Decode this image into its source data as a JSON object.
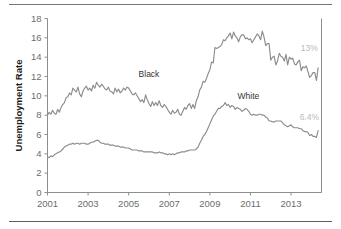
{
  "figure": {
    "background_color": "#ffffff",
    "rule_color": "#6e6e6e",
    "has_top_rule": true,
    "has_bottom_rule": true
  },
  "chart_data": {
    "type": "line",
    "title": "",
    "xlabel": "",
    "ylabel": "Unemployment Rate",
    "xlim": [
      2001.0,
      2014.5
    ],
    "ylim": [
      0,
      18
    ],
    "yticks": [
      0,
      2,
      4,
      6,
      8,
      10,
      12,
      14,
      16,
      18
    ],
    "ytick_labels": [
      "0",
      "2",
      "4",
      "6",
      "8",
      "10",
      "12",
      "14",
      "16",
      "18"
    ],
    "xticks": [
      2001,
      2003,
      2005,
      2007,
      2009,
      2011,
      2013
    ],
    "xtick_labels": [
      "2001",
      "2003",
      "2005",
      "2007",
      "2009",
      "2011",
      "2013"
    ],
    "grid": false,
    "legend_position": "inline-annotation",
    "line_color": "#8c8c8c",
    "annotations": [
      {
        "name": "black-end-value",
        "text": "13%",
        "color": "#b9b9b9",
        "x": 2013.9,
        "y": 14.6
      },
      {
        "name": "white-end-value",
        "text": "6.4%",
        "color": "#b9b9b9",
        "x": 2013.9,
        "y": 7.5
      }
    ],
    "series": [
      {
        "name": "Black",
        "label": "Black",
        "label_x": 2006.0,
        "label_y": 11.9,
        "color": "#8c8c8c",
        "x": [
          2001.0,
          2001.083,
          2001.167,
          2001.25,
          2001.333,
          2001.417,
          2001.5,
          2001.583,
          2001.667,
          2001.75,
          2001.833,
          2001.917,
          2002.0,
          2002.083,
          2002.167,
          2002.25,
          2002.333,
          2002.417,
          2002.5,
          2002.583,
          2002.667,
          2002.75,
          2002.833,
          2002.917,
          2003.0,
          2003.083,
          2003.167,
          2003.25,
          2003.333,
          2003.417,
          2003.5,
          2003.583,
          2003.667,
          2003.75,
          2003.833,
          2003.917,
          2004.0,
          2004.083,
          2004.167,
          2004.25,
          2004.333,
          2004.417,
          2004.5,
          2004.583,
          2004.667,
          2004.75,
          2004.833,
          2004.917,
          2005.0,
          2005.083,
          2005.167,
          2005.25,
          2005.333,
          2005.417,
          2005.5,
          2005.583,
          2005.667,
          2005.75,
          2005.833,
          2005.917,
          2006.0,
          2006.083,
          2006.167,
          2006.25,
          2006.333,
          2006.417,
          2006.5,
          2006.583,
          2006.667,
          2006.75,
          2006.833,
          2006.917,
          2007.0,
          2007.083,
          2007.167,
          2007.25,
          2007.333,
          2007.417,
          2007.5,
          2007.583,
          2007.667,
          2007.75,
          2007.833,
          2007.917,
          2008.0,
          2008.083,
          2008.167,
          2008.25,
          2008.333,
          2008.417,
          2008.5,
          2008.583,
          2008.667,
          2008.75,
          2008.833,
          2008.917,
          2009.0,
          2009.083,
          2009.167,
          2009.25,
          2009.333,
          2009.417,
          2009.5,
          2009.583,
          2009.667,
          2009.75,
          2009.833,
          2009.917,
          2010.0,
          2010.083,
          2010.167,
          2010.25,
          2010.333,
          2010.417,
          2010.5,
          2010.583,
          2010.667,
          2010.75,
          2010.833,
          2010.917,
          2011.0,
          2011.083,
          2011.167,
          2011.25,
          2011.333,
          2011.417,
          2011.5,
          2011.583,
          2011.667,
          2011.75,
          2011.833,
          2011.917,
          2012.0,
          2012.083,
          2012.167,
          2012.25,
          2012.333,
          2012.417,
          2012.5,
          2012.583,
          2012.667,
          2012.75,
          2012.833,
          2012.917,
          2013.0,
          2013.083,
          2013.167,
          2013.25,
          2013.333,
          2013.417,
          2013.5,
          2013.583,
          2013.667,
          2013.75,
          2013.833,
          2013.917,
          2014.0,
          2014.083,
          2014.167,
          2014.25,
          2014.333
        ],
        "y": [
          8.0,
          8.3,
          8.1,
          8.5,
          8.2,
          8.1,
          8.6,
          8.3,
          8.8,
          9.1,
          9.3,
          9.8,
          9.9,
          10.3,
          10.1,
          10.8,
          10.6,
          10.4,
          10.9,
          10.2,
          9.9,
          10.5,
          10.8,
          11.0,
          10.6,
          10.8,
          10.5,
          11.1,
          10.8,
          11.4,
          11.1,
          10.9,
          11.2,
          11.0,
          10.7,
          10.6,
          10.9,
          10.5,
          10.4,
          10.2,
          10.8,
          10.4,
          10.7,
          10.3,
          10.5,
          10.8,
          10.6,
          10.9,
          10.8,
          10.5,
          10.2,
          10.1,
          10.3,
          10.0,
          9.7,
          9.4,
          9.6,
          9.3,
          10.1,
          9.6,
          9.2,
          8.9,
          9.4,
          9.0,
          9.3,
          9.0,
          9.5,
          9.0,
          8.8,
          9.1,
          8.9,
          8.6,
          8.3,
          8.1,
          8.5,
          8.2,
          8.3,
          8.6,
          8.1,
          8.0,
          8.4,
          8.8,
          8.6,
          9.0,
          9.2,
          8.7,
          9.1,
          8.7,
          9.5,
          9.9,
          10.6,
          10.9,
          11.5,
          11.4,
          11.8,
          12.3,
          12.7,
          13.5,
          13.4,
          15.0,
          14.9,
          15.0,
          15.1,
          15.3,
          15.8,
          15.7,
          16.0,
          16.2,
          16.5,
          15.9,
          16.6,
          16.2,
          16.0,
          15.6,
          16.1,
          16.3,
          16.3,
          15.9,
          16.0,
          15.8,
          15.9,
          15.5,
          15.8,
          16.1,
          16.4,
          16.2,
          15.8,
          16.7,
          16.1,
          15.2,
          15.4,
          15.4,
          13.7,
          14.0,
          14.1,
          13.2,
          13.6,
          14.4,
          14.1,
          14.0,
          13.6,
          14.3,
          13.2,
          14.0,
          13.8,
          13.9,
          13.3,
          13.2,
          13.5,
          13.7,
          12.6,
          13.0,
          12.9,
          13.1,
          12.5,
          11.9,
          12.1,
          12.4,
          12.4,
          11.6,
          12.9
        ]
      },
      {
        "name": "White",
        "label": "White",
        "label_x": 2010.9,
        "label_y": 9.7,
        "color": "#8c8c8c",
        "x": [
          2001.0,
          2001.083,
          2001.167,
          2001.25,
          2001.333,
          2001.417,
          2001.5,
          2001.583,
          2001.667,
          2001.75,
          2001.833,
          2001.917,
          2002.0,
          2002.083,
          2002.167,
          2002.25,
          2002.333,
          2002.417,
          2002.5,
          2002.583,
          2002.667,
          2002.75,
          2002.833,
          2002.917,
          2003.0,
          2003.083,
          2003.167,
          2003.25,
          2003.333,
          2003.417,
          2003.5,
          2003.583,
          2003.667,
          2003.75,
          2003.833,
          2003.917,
          2004.0,
          2004.083,
          2004.167,
          2004.25,
          2004.333,
          2004.417,
          2004.5,
          2004.583,
          2004.667,
          2004.75,
          2004.833,
          2004.917,
          2005.0,
          2005.083,
          2005.167,
          2005.25,
          2005.333,
          2005.417,
          2005.5,
          2005.583,
          2005.667,
          2005.75,
          2005.833,
          2005.917,
          2006.0,
          2006.083,
          2006.167,
          2006.25,
          2006.333,
          2006.417,
          2006.5,
          2006.583,
          2006.667,
          2006.75,
          2006.833,
          2006.917,
          2007.0,
          2007.083,
          2007.167,
          2007.25,
          2007.333,
          2007.417,
          2007.5,
          2007.583,
          2007.667,
          2007.75,
          2007.833,
          2007.917,
          2008.0,
          2008.083,
          2008.167,
          2008.25,
          2008.333,
          2008.417,
          2008.5,
          2008.583,
          2008.667,
          2008.75,
          2008.833,
          2008.917,
          2009.0,
          2009.083,
          2009.167,
          2009.25,
          2009.333,
          2009.417,
          2009.5,
          2009.583,
          2009.667,
          2009.75,
          2009.833,
          2009.917,
          2010.0,
          2010.083,
          2010.167,
          2010.25,
          2010.333,
          2010.417,
          2010.5,
          2010.583,
          2010.667,
          2010.75,
          2010.833,
          2010.917,
          2011.0,
          2011.083,
          2011.167,
          2011.25,
          2011.333,
          2011.417,
          2011.5,
          2011.583,
          2011.667,
          2011.75,
          2011.833,
          2011.917,
          2012.0,
          2012.083,
          2012.167,
          2012.25,
          2012.333,
          2012.417,
          2012.5,
          2012.583,
          2012.667,
          2012.75,
          2012.833,
          2012.917,
          2013.0,
          2013.083,
          2013.167,
          2013.25,
          2013.333,
          2013.417,
          2013.5,
          2013.583,
          2013.667,
          2013.75,
          2013.833,
          2013.917,
          2014.0,
          2014.083,
          2014.167,
          2014.25,
          2014.333
        ],
        "y": [
          3.7,
          3.6,
          3.8,
          3.7,
          3.9,
          4.0,
          4.1,
          4.2,
          4.3,
          4.5,
          4.7,
          4.8,
          4.9,
          5.0,
          5.0,
          5.1,
          5.0,
          5.1,
          5.1,
          5.0,
          5.1,
          5.1,
          5.1,
          5.0,
          5.0,
          5.1,
          5.2,
          5.2,
          5.3,
          5.4,
          5.4,
          5.2,
          5.1,
          5.1,
          5.0,
          5.0,
          5.0,
          4.9,
          4.9,
          4.9,
          4.8,
          4.8,
          4.8,
          4.7,
          4.7,
          4.7,
          4.6,
          4.6,
          4.6,
          4.5,
          4.4,
          4.4,
          4.4,
          4.4,
          4.3,
          4.3,
          4.3,
          4.2,
          4.2,
          4.2,
          4.2,
          4.2,
          4.2,
          4.1,
          4.1,
          4.1,
          4.2,
          4.1,
          4.1,
          4.0,
          4.0,
          3.9,
          4.0,
          3.9,
          4.0,
          3.9,
          4.0,
          4.1,
          4.1,
          4.2,
          4.2,
          4.2,
          4.3,
          4.3,
          4.4,
          4.4,
          4.4,
          4.4,
          4.5,
          4.7,
          5.1,
          5.4,
          5.8,
          6.0,
          6.3,
          6.7,
          7.1,
          7.5,
          7.9,
          8.1,
          8.4,
          8.7,
          8.7,
          8.9,
          9.0,
          9.3,
          9.0,
          9.1,
          8.8,
          9.0,
          8.9,
          8.6,
          8.8,
          8.7,
          8.6,
          8.4,
          8.5,
          8.7,
          8.6,
          8.4,
          8.1,
          8.0,
          8.1,
          8.0,
          8.0,
          8.1,
          8.1,
          8.0,
          8.0,
          7.8,
          7.7,
          7.4,
          7.4,
          7.3,
          7.3,
          7.4,
          7.4,
          7.4,
          7.4,
          7.2,
          7.0,
          6.9,
          6.8,
          6.9,
          7.0,
          6.8,
          6.7,
          6.7,
          6.7,
          6.6,
          6.6,
          6.4,
          6.3,
          6.3,
          6.2,
          5.9,
          6.0,
          5.8,
          5.8,
          5.7,
          6.4
        ]
      }
    ]
  }
}
